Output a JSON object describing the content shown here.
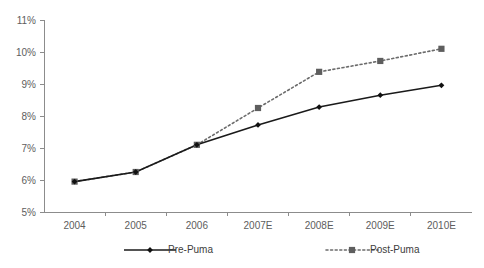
{
  "chart_data": {
    "type": "line",
    "title": "",
    "xlabel": "",
    "ylabel": "",
    "categories": [
      "2004",
      "2005",
      "2006",
      "2007E",
      "2008E",
      "2009E",
      "2010E"
    ],
    "series": [
      {
        "name": "Pre-Puma",
        "values": [
          5.95,
          6.25,
          7.1,
          7.72,
          8.28,
          8.65,
          8.96
        ],
        "line_style": "solid",
        "marker": "diamond",
        "color": "#111111"
      },
      {
        "name": "Post-Puma",
        "values": [
          5.95,
          6.25,
          7.1,
          8.25,
          9.38,
          9.72,
          10.1
        ],
        "line_style": "dotted",
        "marker": "square",
        "color": "#5e5e5e"
      }
    ],
    "ylim": [
      5,
      11
    ],
    "ytick_step": 1,
    "ytick_labels": [
      "5%",
      "6%",
      "7%",
      "8%",
      "9%",
      "10%",
      "11%"
    ],
    "value_suffix": "%",
    "grid": false,
    "legend_position": "bottom"
  },
  "axes": {
    "y_axis_name": "percent-axis",
    "x_axis_name": "year-axis"
  },
  "legend": {
    "entries": [
      {
        "label": "Pre-Puma",
        "marker": "diamond",
        "style": "solid"
      },
      {
        "label": "Post-Puma",
        "marker": "square",
        "style": "dotted"
      }
    ]
  },
  "colors": {
    "axis": "#8c8c8c",
    "tick_text": "#5d5d5d",
    "pre_series": "#111111",
    "post_series": "#5e5e5e",
    "background": "#ffffff"
  }
}
